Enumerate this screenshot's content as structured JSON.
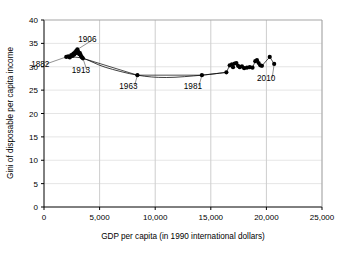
{
  "chart_data": {
    "type": "scatter",
    "title": "",
    "subtitle": "",
    "xlabel": "GDP per capita (in 1990 international dollars)",
    "ylabel": "Gini of disposable per capita income",
    "xlim": [
      0,
      25000
    ],
    "ylim": [
      0,
      40
    ],
    "xticks": [
      0,
      5000,
      10000,
      15000,
      20000,
      25000
    ],
    "xticklabels": [
      "0",
      "5,000",
      "10,000",
      "15,000",
      "20,000",
      "25,000"
    ],
    "yticks": [
      0,
      5,
      10,
      15,
      20,
      25,
      30,
      35,
      40
    ],
    "yticklabels": [
      "0",
      "5",
      "10",
      "15",
      "20",
      "25",
      "30",
      "35",
      "40"
    ],
    "grid": "vertical",
    "legend": "none",
    "marker_color": "#000000",
    "line_color": "#000000",
    "series": [
      {
        "name": "Gini of disposable per capita income vs GDP per capita",
        "marker": "filled-circle",
        "connected": true,
        "points": [
          {
            "x": 2000,
            "y": 32.1,
            "label": "1882"
          },
          {
            "x": 2180,
            "y": 32.2
          },
          {
            "x": 2320,
            "y": 32.0
          },
          {
            "x": 2450,
            "y": 32.5
          },
          {
            "x": 2560,
            "y": 32.3
          },
          {
            "x": 2640,
            "y": 32.8
          },
          {
            "x": 2720,
            "y": 32.6
          },
          {
            "x": 2790,
            "y": 33.1
          },
          {
            "x": 2850,
            "y": 32.9
          },
          {
            "x": 2900,
            "y": 33.4
          },
          {
            "x": 2950,
            "y": 33.2
          },
          {
            "x": 3000,
            "y": 33.7,
            "label": "1906"
          },
          {
            "x": 3060,
            "y": 33.3
          },
          {
            "x": 3120,
            "y": 33.0
          },
          {
            "x": 3170,
            "y": 32.7
          },
          {
            "x": 3230,
            "y": 32.9
          },
          {
            "x": 3290,
            "y": 32.5
          },
          {
            "x": 3350,
            "y": 32.2
          },
          {
            "x": 3420,
            "y": 32.0
          },
          {
            "x": 3500,
            "y": 31.8,
            "label": "1913"
          },
          {
            "x": 8400,
            "y": 28.2,
            "label": "1963"
          },
          {
            "x": 14200,
            "y": 28.2,
            "label": "1981"
          },
          {
            "x": 16400,
            "y": 28.8
          },
          {
            "x": 16700,
            "y": 30.3
          },
          {
            "x": 16900,
            "y": 30.5
          },
          {
            "x": 17000,
            "y": 29.9
          },
          {
            "x": 17150,
            "y": 30.7
          },
          {
            "x": 17300,
            "y": 30.8
          },
          {
            "x": 17450,
            "y": 30.2
          },
          {
            "x": 17600,
            "y": 29.9
          },
          {
            "x": 17800,
            "y": 30.1
          },
          {
            "x": 18000,
            "y": 29.7
          },
          {
            "x": 18250,
            "y": 29.8
          },
          {
            "x": 18500,
            "y": 29.9
          },
          {
            "x": 18750,
            "y": 29.8
          },
          {
            "x": 19000,
            "y": 31.2
          },
          {
            "x": 19150,
            "y": 31.4
          },
          {
            "x": 19300,
            "y": 30.8
          },
          {
            "x": 19450,
            "y": 30.3
          },
          {
            "x": 19600,
            "y": 30.2
          },
          {
            "x": 20300,
            "y": 32.1
          },
          {
            "x": 20700,
            "y": 30.6,
            "label": "2010"
          }
        ],
        "trend_line": [
          {
            "x": 2000,
            "y": 32.1
          },
          {
            "x": 3500,
            "y": 31.8
          },
          {
            "x": 5500,
            "y": 29.9
          },
          {
            "x": 8400,
            "y": 28.2
          },
          {
            "x": 11000,
            "y": 27.7
          },
          {
            "x": 14200,
            "y": 28.2
          },
          {
            "x": 16400,
            "y": 28.8
          }
        ]
      }
    ],
    "annotations": [
      {
        "text": "1882",
        "x": 2000,
        "y": 32.1,
        "dx": -26,
        "dy": 10
      },
      {
        "text": "1906",
        "x": 3000,
        "y": 33.7,
        "dx": 10,
        "dy": -7
      },
      {
        "text": "1913",
        "x": 3500,
        "y": 31.8,
        "dx": -2,
        "dy": 15
      },
      {
        "text": "1963",
        "x": 8400,
        "y": 28.2,
        "dx": -9,
        "dy": 14
      },
      {
        "text": "1981",
        "x": 14200,
        "y": 28.2,
        "dx": -9,
        "dy": 14
      },
      {
        "text": "2010",
        "x": 20700,
        "y": 30.6,
        "dx": -8,
        "dy": 17
      }
    ]
  }
}
